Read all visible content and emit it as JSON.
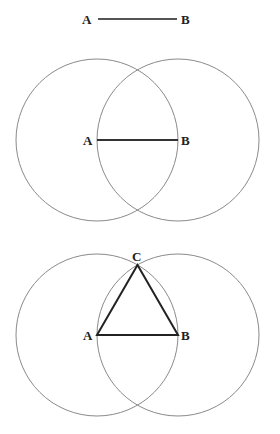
{
  "figures": [
    {
      "name": "step-1-segment",
      "points": {
        "A": "A",
        "B": "B"
      }
    },
    {
      "name": "step-2-circles",
      "points": {
        "A": "A",
        "B": "B"
      }
    },
    {
      "name": "step-3-triangle",
      "points": {
        "A": "A",
        "B": "B",
        "C": "C"
      }
    }
  ],
  "colors": {
    "circle_stroke": "#8a8a8a",
    "segment_stroke": "#333333",
    "background": "#ffffff"
  }
}
